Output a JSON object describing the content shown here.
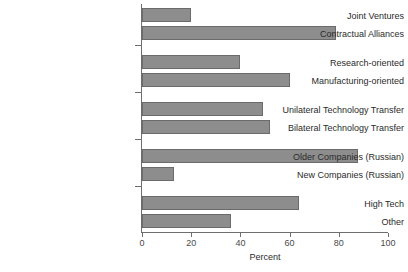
{
  "chart_data": {
    "type": "bar",
    "orientation": "horizontal",
    "title": "",
    "xlabel": "Percent",
    "ylabel": "",
    "xlim": [
      0,
      100
    ],
    "xticks": [
      0,
      20,
      40,
      60,
      80,
      100
    ],
    "xtick_labels": [
      "0",
      "20",
      "40",
      "60",
      "80",
      "100"
    ],
    "grid": false,
    "legend": null,
    "bar_color": "#8d8d8d",
    "bar_edge_color": "#6b6b6b",
    "axis_color": "#6e6e6e",
    "categories": [
      "Joint Ventures",
      "Contractual Alliances",
      "Research-oriented",
      "Manufacturing-oriented",
      "Unilateral Technology Transfer",
      "Bilateral Technology Transfer",
      "Older Companies (Russian)",
      "New Companies (Russian)",
      "High Tech",
      "Other"
    ],
    "values": [
      20,
      79,
      40,
      60,
      49,
      52,
      88,
      13,
      64,
      36
    ],
    "groups": [
      {
        "name": "group-1",
        "categories": [
          "Joint Ventures",
          "Contractual Alliances"
        ]
      },
      {
        "name": "group-2",
        "categories": [
          "Research-oriented",
          "Manufacturing-oriented"
        ]
      },
      {
        "name": "group-3",
        "categories": [
          "Unilateral Technology Transfer",
          "Bilateral Technology Transfer"
        ]
      },
      {
        "name": "group-4",
        "categories": [
          "Older Companies (Russian)",
          "New Companies (Russian)"
        ]
      },
      {
        "name": "group-5",
        "categories": [
          "High Tech",
          "Other"
        ]
      }
    ]
  }
}
